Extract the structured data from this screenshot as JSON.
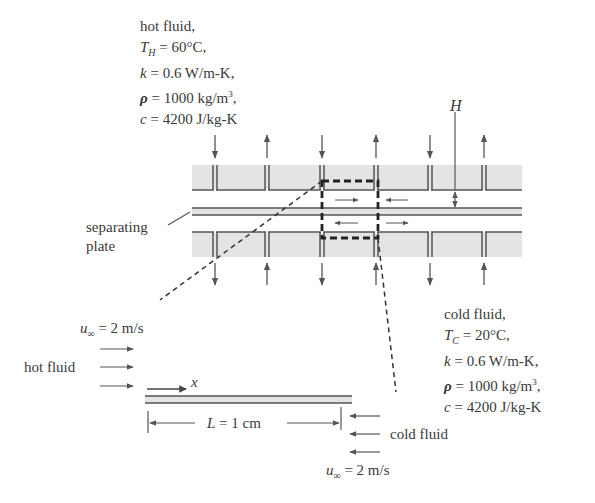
{
  "hot_fluid_props": {
    "title": "hot fluid,",
    "temp_symbol": "T",
    "temp_sub": "H",
    "temp_value": " = 60°C,",
    "k_symbol": "k",
    "k_value": " = 0.6 W/m-K,",
    "rho_symbol": "ρ",
    "rho_value": " = 1000 kg/m",
    "rho_exp": "3",
    "rho_end": ",",
    "c_symbol": "c",
    "c_value": " = 4200 J/kg-K"
  },
  "cold_fluid_props": {
    "title": "cold fluid,",
    "temp_symbol": "T",
    "temp_sub": "C",
    "temp_value": " = 20°C,",
    "k_symbol": "k",
    "k_value": " = 0.6 W/m-K,",
    "rho_symbol": "ρ",
    "rho_value": " = 1000 kg/m",
    "rho_exp": "3",
    "rho_end": ",",
    "c_symbol": "c",
    "c_value": " = 4200 J/kg-K"
  },
  "labels": {
    "height": "H",
    "separating_plate_line1": "separating",
    "separating_plate_line2": "plate",
    "hot_fluid": "hot fluid",
    "cold_fluid": "cold fluid",
    "x_axis": "x",
    "length_symbol": "L",
    "length_value": " =  1 cm",
    "u_symbol": "u",
    "u_sub": "∞",
    "u_value": " = 2 m/s",
    "u_value_bottom": " = 2 m/s"
  },
  "colors": {
    "band_fill": "#e4e4e4",
    "line": "#555555",
    "dash": "#333333",
    "text": "#3a3a3a"
  }
}
